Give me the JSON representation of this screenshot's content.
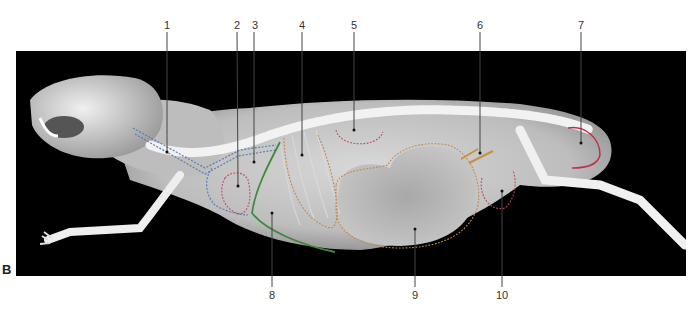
{
  "figure": {
    "panel_label": "B",
    "image_description": "Lateral radiograph of a guinea pig with numbered anatomical labels",
    "labels": [
      {
        "id": "1",
        "x": 167,
        "y_text": 26,
        "line_end_y": 152,
        "position": "top"
      },
      {
        "id": "2",
        "x": 237,
        "y_text": 26,
        "line_end_y": 186,
        "position": "top"
      },
      {
        "id": "3",
        "x": 254,
        "y_text": 26,
        "line_end_y": 162,
        "position": "top"
      },
      {
        "id": "4",
        "x": 302,
        "y_text": 26,
        "line_end_y": 155,
        "position": "top"
      },
      {
        "id": "5",
        "x": 354,
        "y_text": 26,
        "line_end_y": 130,
        "position": "top"
      },
      {
        "id": "6",
        "x": 480,
        "y_text": 26,
        "line_end_y": 153,
        "position": "top"
      },
      {
        "id": "7",
        "x": 581,
        "y_text": 26,
        "line_end_y": 143,
        "position": "top"
      },
      {
        "id": "8",
        "x": 272,
        "y_text": 296,
        "line_end_y": 213,
        "position": "bottom"
      },
      {
        "id": "9",
        "x": 415,
        "y_text": 296,
        "line_end_y": 229,
        "position": "bottom"
      },
      {
        "id": "10",
        "x": 502,
        "y_text": 296,
        "line_end_y": 191,
        "position": "bottom"
      }
    ],
    "outline_colors": {
      "blue": "#5a7fb5",
      "red": "#c24a5a",
      "orange": "#c08a4a",
      "green": "#3d8a3a",
      "tan": "#c89040",
      "magenta": "#c0304a"
    }
  }
}
